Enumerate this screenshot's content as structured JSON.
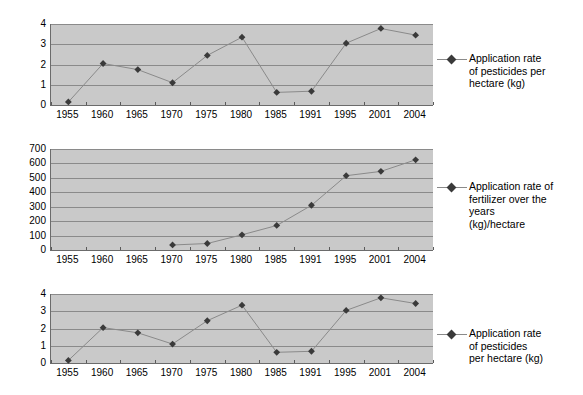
{
  "page": {
    "background_color": "#ffffff",
    "plot_background_color": "#c9c9c9",
    "gridline_color": "#8a8a8a",
    "series_color": "#8a8a8a",
    "marker_color": "#3a3a3a"
  },
  "charts": [
    {
      "id": "chart-pesticides-top",
      "legend_label": "Application rate\nof pesticides per\nhectare (kg)",
      "chart_data": {
        "type": "line",
        "title": "",
        "xlabel": "",
        "ylabel": "",
        "categories": [
          "1955",
          "1960",
          "1965",
          "1970",
          "1975",
          "1980",
          "1985",
          "1991",
          "1995",
          "2001",
          "2004"
        ],
        "values": [
          0.15,
          2.05,
          1.75,
          1.1,
          2.45,
          3.35,
          0.62,
          0.68,
          3.05,
          3.78,
          3.45
        ],
        "ylim": [
          0,
          4
        ],
        "yticks": [
          "0",
          "1",
          "2",
          "3",
          "4"
        ],
        "ytick_values": [
          0,
          1,
          2,
          3,
          4
        ],
        "grid": true,
        "legend_position": "right",
        "legend_entries": [
          "Application rate of pesticides per hectare (kg)"
        ]
      }
    },
    {
      "id": "chart-fertilizer-middle",
      "legend_label": "Application rate of\nfertilizer over the\nyears\n(kg)/hectare",
      "chart_data": {
        "type": "line",
        "title": "",
        "xlabel": "",
        "ylabel": "",
        "categories": [
          "1955",
          "1960",
          "1965",
          "1970",
          "1975",
          "1980",
          "1985",
          "1991",
          "1995",
          "2001",
          "2004"
        ],
        "values": [
          null,
          null,
          null,
          35,
          45,
          105,
          170,
          310,
          515,
          545,
          625
        ],
        "ylim": [
          0,
          700
        ],
        "yticks": [
          "0",
          "100",
          "200",
          "300",
          "400",
          "500",
          "600",
          "700"
        ],
        "ytick_values": [
          0,
          100,
          200,
          300,
          400,
          500,
          600,
          700
        ],
        "grid": true,
        "legend_position": "right",
        "legend_entries": [
          "Application rate of fertilizer over the years (kg)/hectare"
        ]
      }
    },
    {
      "id": "chart-pesticides-bottom",
      "legend_label": "Application rate\nof pesticides\nper hectare (kg)",
      "chart_data": {
        "type": "line",
        "title": "",
        "xlabel": "",
        "ylabel": "",
        "categories": [
          "1955",
          "1960",
          "1965",
          "1970",
          "1975",
          "1980",
          "1985",
          "1991",
          "1995",
          "2001",
          "2004"
        ],
        "values": [
          0.15,
          2.05,
          1.75,
          1.1,
          2.45,
          3.35,
          0.62,
          0.68,
          3.05,
          3.78,
          3.45
        ],
        "ylim": [
          0,
          4
        ],
        "yticks": [
          "0",
          "1",
          "2",
          "3",
          "4"
        ],
        "ytick_values": [
          0,
          1,
          2,
          3,
          4
        ],
        "grid": true,
        "legend_position": "right",
        "legend_entries": [
          "Application rate of pesticides per hectare (kg)"
        ]
      }
    }
  ],
  "layout": [
    {
      "block_top": 0,
      "plot_left": 50,
      "plot_top": 24,
      "plot_width": 382,
      "plot_height": 81,
      "legend_left": 437,
      "legend_top": 52
    },
    {
      "block_top": 0,
      "plot_left": 50,
      "plot_top": 149,
      "plot_width": 382,
      "plot_height": 101,
      "legend_left": 437,
      "legend_top": 180
    },
    {
      "block_top": 0,
      "plot_left": 50,
      "plot_top": 294,
      "plot_width": 382,
      "plot_height": 69,
      "legend_left": 437,
      "legend_top": 327
    }
  ]
}
